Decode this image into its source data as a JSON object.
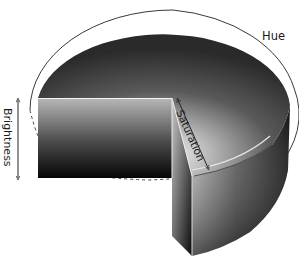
{
  "diagram": {
    "labels": {
      "hue": "Hue",
      "saturation": "Saturation",
      "brightness": "Brightness"
    },
    "axes": [
      {
        "name": "Hue",
        "kind": "angular",
        "indicator": "outer ring arc"
      },
      {
        "name": "Saturation",
        "kind": "radial",
        "indicator": "double-headed arrow from center to rim"
      },
      {
        "name": "Brightness",
        "kind": "vertical",
        "indicator": "double-headed arrow along height"
      }
    ],
    "colors": {
      "background": "#ffffff",
      "outline": "#3a3a3a",
      "dark": "#0a0a0a",
      "light": "#f2f2f2"
    }
  }
}
